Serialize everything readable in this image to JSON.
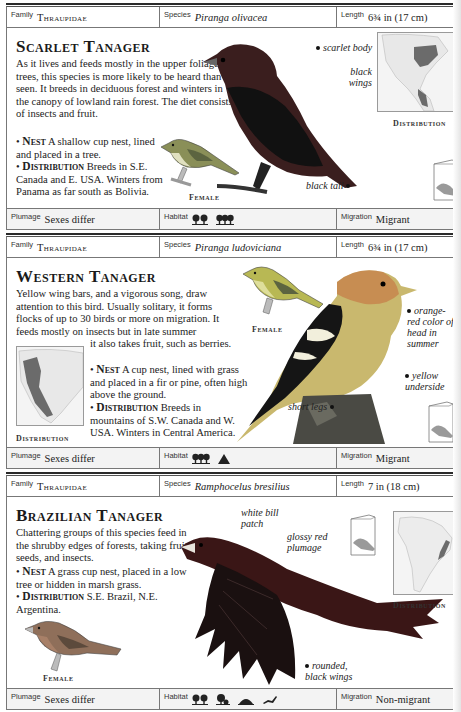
{
  "entries": [
    {
      "info": {
        "family_label": "Family",
        "family": "Thraupidae",
        "species_label": "Species",
        "species": "Piranga olivacea",
        "length_label": "Length",
        "length": "6¾ in (17 cm)"
      },
      "title": "Scarlet Tanager",
      "description": "As it lives and feeds mostly in the upper foliage of trees, this species is more likely to be heard than seen. It breeds in deciduous forest and winters in the canopy of lowland rain forest. The diet consists of insects and fruit.",
      "nest_label": "Nest",
      "nest": "A shallow cup nest, lined and placed in a tree.",
      "distribution_label": "Distribution",
      "distribution": "Breeds in S.E. Canada and E. USA. Winters from Panama as far south as Bolivia.",
      "female_caption": "Female",
      "map_caption": "Distribution",
      "annotations": [
        "scarlet body",
        "black wings",
        "black tail"
      ],
      "footer": {
        "plumage_label": "Plumage",
        "plumage": "Sexes differ",
        "habitat_label": "Habitat",
        "habitat_icons": [
          "deciduous-forest-icon",
          "mixed-forest-icon"
        ],
        "migration_label": "Migration",
        "migration": "Migrant"
      }
    },
    {
      "info": {
        "family_label": "Family",
        "family": "Thraupidae",
        "species_label": "Species",
        "species": "Piranga ludoviciana",
        "length_label": "Length",
        "length": "6¾ in (17 cm)"
      },
      "title": "Western Tanager",
      "description": "Yellow wing bars, and a vigorous song, draw attention to this bird. Usually solitary, it forms flocks of up to 30 birds or more on migration. It feeds mostly on insects but in late summer",
      "description_cont": "it also takes fruit, such as berries.",
      "nest_label": "Nest",
      "nest": "A cup nest, lined with grass and placed in a fir or pine, often high above the ground.",
      "distribution_label": "Distribution",
      "distribution": "Breeds in mountains of S.W. Canada and W. USA. Winters in Central America.",
      "female_caption": "Female",
      "map_caption": "Distribution",
      "annotations": [
        "orange-red color of head in summer",
        "yellow underside",
        "short legs"
      ],
      "footer": {
        "plumage_label": "Plumage",
        "plumage": "Sexes differ",
        "habitat_label": "Habitat",
        "habitat_icons": [
          "coniferous-forest-icon",
          "mountain-icon"
        ],
        "migration_label": "Migration",
        "migration": "Migrant"
      }
    },
    {
      "info": {
        "family_label": "Family",
        "family": "Thraupidae",
        "species_label": "Species",
        "species": "Ramphocelus bresilius",
        "length_label": "Length",
        "length": "7 in (18 cm)"
      },
      "title": "Brazilian Tanager",
      "description": "Chattering groups of this species feed in the shrubby edges of forests, taking fruits, seeds, and insects.",
      "nest_label": "Nest",
      "nest": "A grass cup nest, placed in a low tree or hidden in marsh grass.",
      "distribution_label": "Distribution",
      "distribution": "S.E. Brazil, N.E. Argentina.",
      "female_caption": "Female",
      "map_caption": "Distribution",
      "annotations": [
        "white bill patch",
        "glossy red plumage",
        "rounded, black wings"
      ],
      "footer": {
        "plumage_label": "Plumage",
        "plumage": "Sexes differ",
        "habitat_label": "Habitat",
        "habitat_icons": [
          "deciduous-forest-icon",
          "scrub-icon",
          "marsh-icon",
          "farmland-icon"
        ],
        "migration_label": "Migration",
        "migration": "Non-migrant"
      }
    }
  ]
}
